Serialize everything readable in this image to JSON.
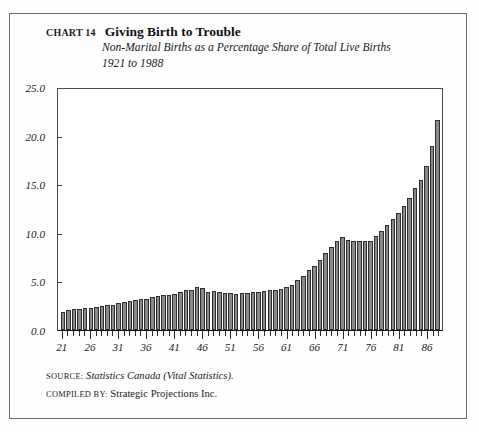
{
  "header": {
    "chart_number": "CHART 14",
    "title": "Giving Birth to Trouble",
    "subtitle_line1": "Non-Marital Births as a Percentage Share of Total Live Births",
    "subtitle_line2": "1921 to 1988"
  },
  "footer": {
    "source_label": "Source:",
    "source_value": "Statistics Canada (Vital Statistics).",
    "compiled_label": "Compiled by:",
    "compiled_value": "Strategic Projections Inc."
  },
  "colors": {
    "bar_fill": "#8a8a8a",
    "bar_edge": "#2e2e2e",
    "axis": "#1a1a1a",
    "frame": "#6e6e6e",
    "background": "#fefefe"
  },
  "chart_data": {
    "type": "bar",
    "title": "Giving Birth to Trouble",
    "subtitle": "Non-Marital Births as a Percentage Share of Total Live Births, 1921 to 1988",
    "xlabel": "",
    "ylabel": "",
    "ylim": [
      0.0,
      25.0
    ],
    "yticks": [
      0.0,
      5.0,
      10.0,
      15.0,
      20.0,
      25.0
    ],
    "ytick_labels": [
      "0.0",
      "5.0",
      "10.0",
      "15.0",
      "20.0",
      "25.0"
    ],
    "xlim": [
      1921,
      1988
    ],
    "xtick_labels": [
      "21",
      "26",
      "31",
      "36",
      "41",
      "46",
      "51",
      "56",
      "61",
      "66",
      "71",
      "76",
      "81",
      "86"
    ],
    "xtick_years": [
      1921,
      1926,
      1931,
      1936,
      1941,
      1946,
      1951,
      1956,
      1961,
      1966,
      1971,
      1976,
      1981,
      1986
    ],
    "grid": false,
    "legend": null,
    "categories": [
      1921,
      1922,
      1923,
      1924,
      1925,
      1926,
      1927,
      1928,
      1929,
      1930,
      1931,
      1932,
      1933,
      1934,
      1935,
      1936,
      1937,
      1938,
      1939,
      1940,
      1941,
      1942,
      1943,
      1944,
      1945,
      1946,
      1947,
      1948,
      1949,
      1950,
      1951,
      1952,
      1953,
      1954,
      1955,
      1956,
      1957,
      1958,
      1959,
      1960,
      1961,
      1962,
      1963,
      1964,
      1965,
      1966,
      1967,
      1968,
      1969,
      1970,
      1971,
      1972,
      1973,
      1974,
      1975,
      1976,
      1977,
      1978,
      1979,
      1980,
      1981,
      1982,
      1983,
      1984,
      1985,
      1986,
      1987,
      1988
    ],
    "values": [
      1.9,
      2.1,
      2.2,
      2.2,
      2.3,
      2.3,
      2.4,
      2.5,
      2.6,
      2.6,
      2.8,
      2.9,
      3.0,
      3.1,
      3.2,
      3.2,
      3.4,
      3.5,
      3.6,
      3.6,
      3.7,
      3.9,
      4.1,
      4.2,
      4.5,
      4.4,
      3.9,
      4.0,
      3.9,
      3.8,
      3.8,
      3.7,
      3.8,
      3.8,
      3.9,
      3.9,
      4.0,
      4.1,
      4.2,
      4.3,
      4.5,
      4.7,
      5.2,
      5.6,
      6.2,
      6.6,
      7.3,
      8.0,
      8.6,
      9.2,
      9.6,
      9.3,
      9.2,
      9.2,
      9.2,
      9.2,
      9.8,
      10.3,
      10.9,
      11.5,
      12.1,
      12.9,
      13.7,
      14.7,
      15.6,
      17.0,
      19.1,
      21.8
    ]
  }
}
